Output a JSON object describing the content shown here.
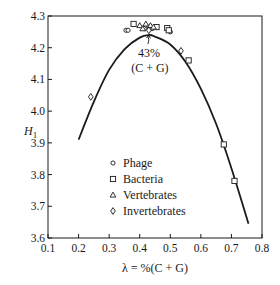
{
  "chart_data": {
    "type": "scatter",
    "title": "",
    "xlabel": "λ = %(C + G)",
    "ylabel": "H₁",
    "ylabel_main": "H",
    "ylabel_sub": "1",
    "xlim": [
      0.1,
      0.8
    ],
    "ylim": [
      3.6,
      4.3
    ],
    "grid": false,
    "x_ticks": [
      0.1,
      0.2,
      0.3,
      0.4,
      0.5,
      0.6,
      0.7,
      0.8
    ],
    "x_tick_labels": [
      "0.1",
      "0.2",
      "0.3",
      "0.4",
      "0.5",
      "0.6",
      "0.7",
      "0.8"
    ],
    "y_ticks": [
      3.6,
      3.7,
      3.8,
      3.9,
      4.0,
      4.1,
      4.2,
      4.3
    ],
    "y_tick_labels": [
      "3.6",
      "3.7",
      "3.8",
      "3.9",
      "4.0",
      "4.1",
      "4.2",
      "4.3"
    ],
    "legend_position": "lower center inside plot",
    "legend": [
      {
        "marker": "circle",
        "label": "Phage"
      },
      {
        "marker": "square",
        "label": "Bacteria"
      },
      {
        "marker": "triangle",
        "label": "Vertebrates"
      },
      {
        "marker": "diamond",
        "label": "Invertebrates"
      }
    ],
    "annotation": {
      "line1": "43%",
      "line2": "(C + G)",
      "x": 0.43,
      "y": 4.24,
      "text_x": 0.43,
      "text_y": 4.15
    },
    "fit_curve": {
      "description": "fitted entropy curve H1(λ)",
      "x": [
        0.2,
        0.25,
        0.3,
        0.35,
        0.4,
        0.43,
        0.45,
        0.5,
        0.55,
        0.6,
        0.65,
        0.7,
        0.756
      ],
      "y": [
        3.91,
        4.03,
        4.13,
        4.195,
        4.232,
        4.24,
        4.235,
        4.21,
        4.155,
        4.07,
        3.96,
        3.82,
        3.645
      ]
    },
    "series": [
      {
        "name": "Phage",
        "marker": "circle",
        "points": [
          [
            0.355,
            4.255
          ],
          [
            0.362,
            4.255
          ],
          [
            0.415,
            4.26
          ],
          [
            0.43,
            4.265
          ],
          [
            0.44,
            4.26
          ],
          [
            0.5,
            4.25
          ]
        ]
      },
      {
        "name": "Bacteria",
        "marker": "square",
        "points": [
          [
            0.38,
            4.275
          ],
          [
            0.455,
            4.265
          ],
          [
            0.49,
            4.262
          ],
          [
            0.495,
            4.255
          ],
          [
            0.56,
            4.16
          ],
          [
            0.675,
            3.895
          ],
          [
            0.71,
            3.78
          ]
        ]
      },
      {
        "name": "Vertebrates",
        "marker": "triangle",
        "points": [
          [
            0.4,
            4.27
          ],
          [
            0.41,
            4.26
          ],
          [
            0.42,
            4.275
          ],
          [
            0.435,
            4.27
          ],
          [
            0.445,
            4.265
          ]
        ]
      },
      {
        "name": "Invertebrates",
        "marker": "diamond",
        "points": [
          [
            0.24,
            4.045
          ],
          [
            0.535,
            4.19
          ],
          [
            0.43,
            4.255
          ]
        ]
      }
    ]
  }
}
